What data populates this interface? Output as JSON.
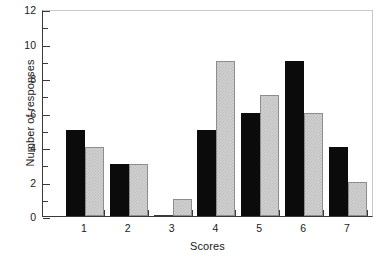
{
  "chart_data": {
    "type": "bar",
    "title": "",
    "subtitle": "",
    "xlabel": "Scores",
    "ylabel": "Number of responses",
    "categories": [
      "1",
      "2",
      "3",
      "4",
      "5",
      "6",
      "7"
    ],
    "series": [
      {
        "name": "black",
        "color": "#0b0b0b",
        "values": [
          5,
          3,
          0,
          5,
          6,
          9,
          4
        ]
      },
      {
        "name": "gray",
        "color": "#d2d2d2",
        "values": [
          4,
          3,
          1,
          9,
          7,
          6,
          2
        ]
      }
    ],
    "ylim": [
      0,
      12
    ],
    "ymajor_ticks": [
      0,
      2,
      4,
      6,
      8,
      10,
      12
    ],
    "yminor_ticks": [
      1,
      3,
      5,
      7,
      9,
      11
    ],
    "ytick_labels": [
      "0",
      "2",
      "4",
      "6",
      "8",
      "10",
      "12"
    ],
    "grid": false,
    "legend": "none"
  },
  "axes": {
    "y_title": "Number of responses",
    "x_title": "Scores"
  }
}
